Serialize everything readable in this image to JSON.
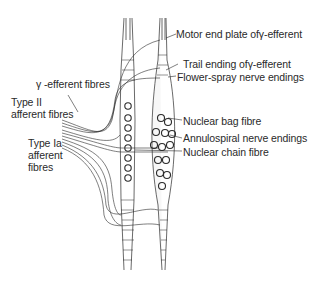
{
  "diagram": {
    "colors": {
      "ink": "#2a2a2a",
      "background": "#ffffff",
      "fibre_fill": "#f2f2f2"
    },
    "labels": {
      "motor_end_plate": "Motor end plate ofγ-efferent",
      "trail_ending": "Trail ending ofγ-efferent",
      "flower_spray": "Flower-spray nerve endings",
      "nuclear_bag": "Nuclear bag fibre",
      "annulospiral": "Annulospiral nerve endings",
      "nuclear_chain": "Nuclear chain fibre",
      "gamma_efferent": "γ -efferent fibres",
      "type_ii_line1": "Type II",
      "type_ii_line2": "afferent fibres",
      "type_ia_line1": "Type Ia",
      "type_ia_line2": "afferent",
      "type_ia_line3": "fibres"
    }
  }
}
